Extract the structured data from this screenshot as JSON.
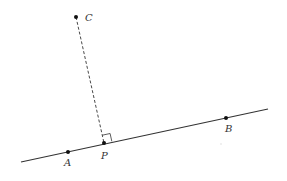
{
  "diagram": {
    "points": [
      {
        "id": "A",
        "label": "A"
      },
      {
        "id": "B",
        "label": "B"
      },
      {
        "id": "C",
        "label": "C"
      },
      {
        "id": "P",
        "label": "P"
      }
    ],
    "segments": [
      {
        "name": "line-AB",
        "style": "solid"
      },
      {
        "name": "perpendicular-CP",
        "style": "dashed"
      }
    ],
    "right_angle_at": "P",
    "colors": {
      "line": "#333333",
      "point": "#111111",
      "label": "#333333"
    }
  }
}
